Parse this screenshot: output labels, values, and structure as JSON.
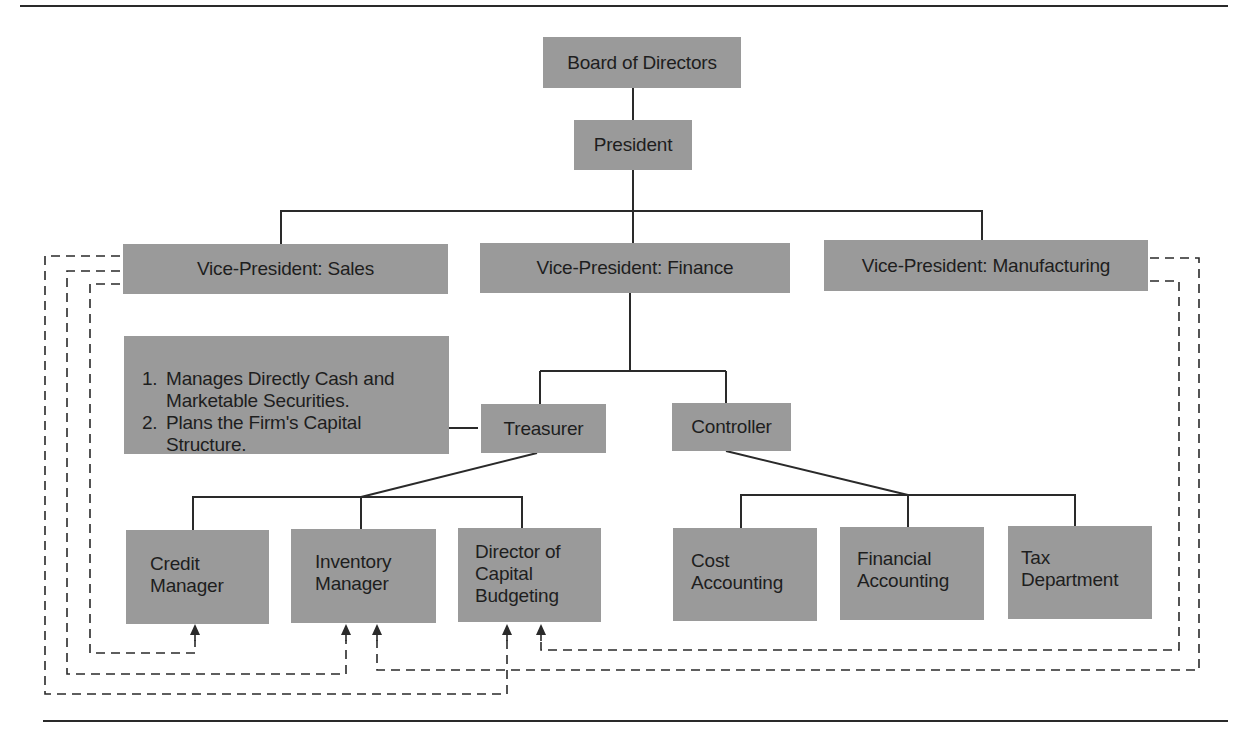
{
  "chart": {
    "nodes": {
      "board": {
        "label": "Board of Directors"
      },
      "president": {
        "label": "President"
      },
      "vp_sales": {
        "label": "Vice-President: Sales"
      },
      "vp_finance": {
        "label": "Vice-President: Finance"
      },
      "vp_manufacturing": {
        "label": "Vice-President: Manufacturing"
      },
      "treasurer": {
        "label": "Treasurer"
      },
      "controller": {
        "label": "Controller"
      },
      "credit_manager": {
        "lines": [
          "Credit",
          "Manager"
        ]
      },
      "inventory_manager": {
        "lines": [
          "Inventory",
          "Manager"
        ]
      },
      "director_capital_budgeting": {
        "lines": [
          "Director of",
          "Capital",
          "Budgeting"
        ]
      },
      "cost_accounting": {
        "lines": [
          "Cost",
          "Accounting"
        ]
      },
      "financial_accounting": {
        "lines": [
          "Financial",
          "Accounting"
        ]
      },
      "tax_department": {
        "lines": [
          "Tax",
          "Department"
        ]
      }
    },
    "treasurer_notes": [
      {
        "num": "1.",
        "text": "Manages Directly Cash and\nMarketable Securities."
      },
      {
        "num": "2.",
        "text": "Plans the Firm's Capital\nStructure."
      }
    ],
    "colors": {
      "box_fill": "#9a9a9a",
      "line": "#2a2a2a",
      "background": "#ffffff"
    }
  }
}
